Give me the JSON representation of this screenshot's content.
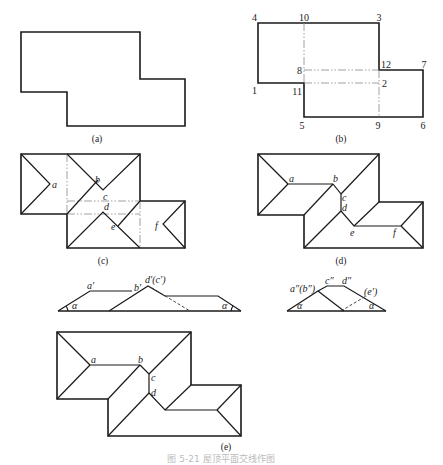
{
  "figure": {
    "caption": "图 5-21  屋顶平面交线作图",
    "panels": [
      {
        "id": "a",
        "label": "(a)",
        "description": "L-shaped building plan outline"
      },
      {
        "id": "b",
        "label": "(b)",
        "description": "Plan divided into rectangles with numbered vertices",
        "vertex_labels": [
          "1",
          "2",
          "3",
          "4",
          "5",
          "6",
          "7",
          "8",
          "9",
          "10",
          "11",
          "12"
        ]
      },
      {
        "id": "c",
        "label": "(c)",
        "description": "Hip-roof ridges drawn on each rectangle",
        "point_labels": [
          "a",
          "b",
          "c",
          "d",
          "e",
          "f"
        ]
      },
      {
        "id": "d",
        "label": "(d)",
        "description": "Resolved roof intersection lines",
        "point_labels": [
          "a",
          "b",
          "c",
          "d",
          "e",
          "f"
        ]
      },
      {
        "id": "elev1",
        "label": "",
        "description": "Front elevation",
        "point_labels": [
          "a′",
          "b′",
          "d′(c′)"
        ],
        "angle_labels": [
          "α",
          "α"
        ]
      },
      {
        "id": "elev2",
        "label": "",
        "description": "Side elevation",
        "point_labels": [
          "a″(b″)",
          "c″",
          "d″",
          "(e′)"
        ],
        "angle_labels": [
          "α",
          "α"
        ]
      },
      {
        "id": "e",
        "label": "(e)",
        "description": "Final roof plan",
        "point_labels": [
          "a",
          "b",
          "c",
          "d"
        ]
      }
    ]
  }
}
